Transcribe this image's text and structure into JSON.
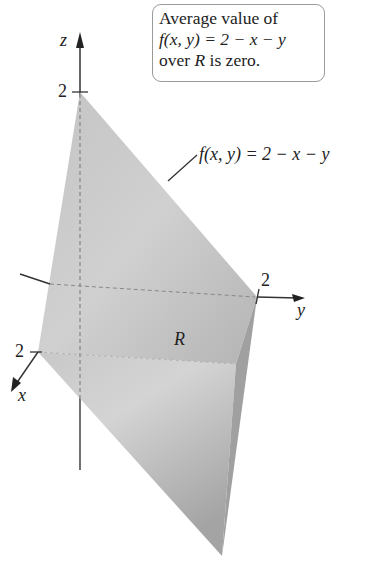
{
  "callout": {
    "line1": "Average value of",
    "line2": "f(x, y) = 2 − x − y",
    "line3_pre": "over ",
    "line3_var": "R",
    "line3_post": " is zero."
  },
  "surface_label": "f(x, y) = 2 − x − y",
  "region_label": "R",
  "axes": {
    "z": {
      "label": "z",
      "tick": "2"
    },
    "y": {
      "label": "y",
      "tick": "2"
    },
    "x": {
      "label": "x",
      "tick": "2"
    }
  },
  "colors": {
    "surface_light": "#d6d6d6",
    "surface_dark": "#a8a8a8",
    "side_face": "#9c9c9c",
    "axis": "#333333"
  }
}
